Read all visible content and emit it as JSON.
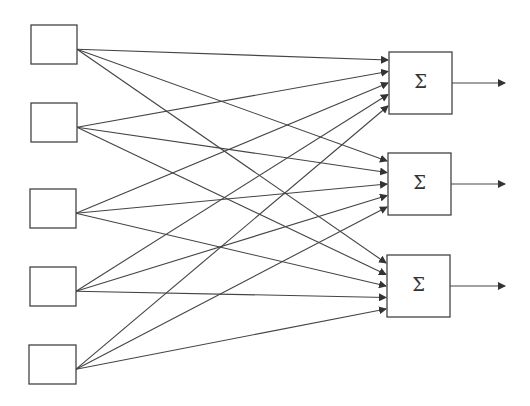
{
  "diagram": {
    "type": "fully-connected-network",
    "inputs": [
      {
        "id": "in1",
        "x": 31,
        "y": 25,
        "w": 46,
        "h": 39
      },
      {
        "id": "in2",
        "x": 31,
        "y": 103,
        "w": 46,
        "h": 39
      },
      {
        "id": "in3",
        "x": 30,
        "y": 189,
        "w": 46,
        "h": 39
      },
      {
        "id": "in4",
        "x": 30,
        "y": 267,
        "w": 46,
        "h": 39
      },
      {
        "id": "in5",
        "x": 29,
        "y": 345,
        "w": 47,
        "h": 39
      }
    ],
    "sum_nodes": [
      {
        "id": "s1",
        "x": 389,
        "y": 52,
        "w": 63,
        "h": 62,
        "label": "Σ"
      },
      {
        "id": "s2",
        "x": 388,
        "y": 153,
        "w": 63,
        "h": 62,
        "label": "Σ"
      },
      {
        "id": "s3",
        "x": 387,
        "y": 255,
        "w": 63,
        "h": 62,
        "label": "Σ"
      }
    ],
    "line_color": "#444444"
  }
}
